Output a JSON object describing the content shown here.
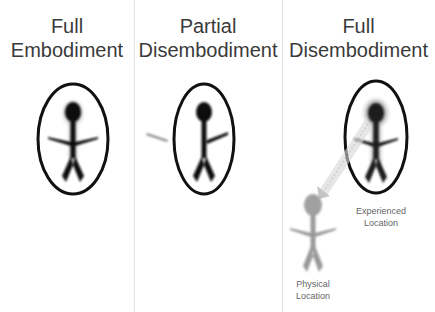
{
  "panels": [
    {
      "title_line1": "Full",
      "title_line2": "Embodiment"
    },
    {
      "title_line1": "Partial",
      "title_line2": "Disembodiment"
    },
    {
      "title_line1": "Full",
      "title_line2": "Disembodiment"
    }
  ],
  "labels": {
    "experienced_line1": "Experienced",
    "experienced_line2": "Location",
    "physical_line1": "Physical",
    "physical_line2": "Location"
  },
  "colors": {
    "figure_dark": "#111111",
    "figure_ghost": "#9a9a9a",
    "ellipse": "#111111",
    "divider": "#e4e4e4",
    "title_text": "#3a3a3a",
    "label_text": "#666666"
  }
}
